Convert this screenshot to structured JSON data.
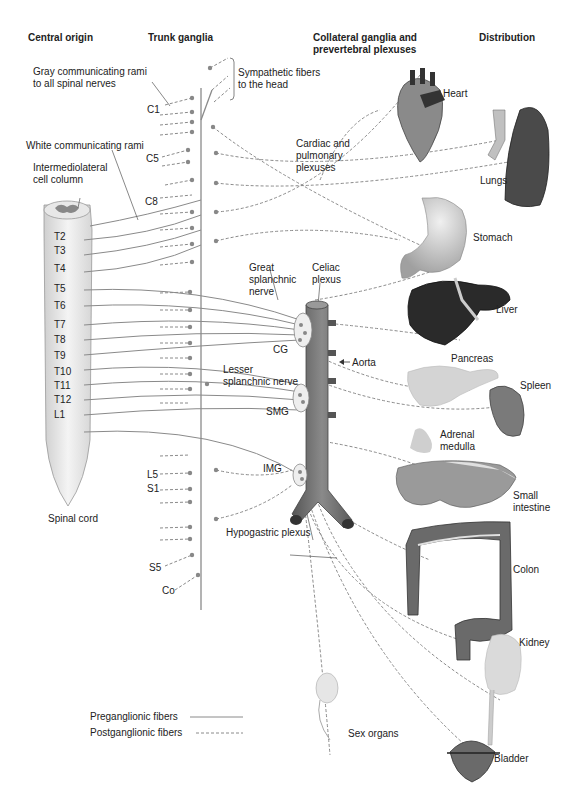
{
  "headers": {
    "central_origin": "Central origin",
    "trunk_ganglia": "Trunk ganglia",
    "collateral_line1": "Collateral ganglia and",
    "collateral_line2": "prevertebral plexuses",
    "distribution": "Distribution"
  },
  "annotations": {
    "gray_rami_1": "Gray communicating rami",
    "gray_rami_2": "to all spinal nerves",
    "symp_head_1": "Sympathetic fibers",
    "symp_head_2": "to the head",
    "white_rami": "White communicating rami",
    "iml_1": "Intermediolateral",
    "iml_2": "cell column",
    "cardiac_1": "Cardiac and",
    "cardiac_2": "pulmonary",
    "cardiac_3": "plexuses",
    "great_1": "Great",
    "great_2": "splanchnic",
    "great_3": "nerve",
    "celiac_1": "Celiac",
    "celiac_2": "plexus",
    "cg": "CG",
    "aorta": "Aorta",
    "lesser_1": "Lesser",
    "lesser_2": "splanchnic nerve",
    "smg": "SMG",
    "img": "IMG",
    "hypogastric": "Hypogastric plexus",
    "spinal_cord": "Spinal cord"
  },
  "segments": {
    "cervical": [
      "C1",
      "C5",
      "C8"
    ],
    "thoracic": [
      "T2",
      "T3",
      "T4",
      "T5",
      "T6",
      "T7",
      "T8",
      "T9",
      "T10",
      "T11",
      "T12",
      "L1"
    ],
    "lower": [
      "L5",
      "S1",
      "S5",
      "Co"
    ]
  },
  "organs": {
    "heart": "Heart",
    "lungs": "Lungs",
    "stomach": "Stomach",
    "liver": "Liver",
    "pancreas": "Pancreas",
    "spleen": "Spleen",
    "adrenal_1": "Adrenal",
    "adrenal_2": "medulla",
    "small_int_1": "Small",
    "small_int_2": "intestine",
    "colon": "Colon",
    "kidney": "Kidney",
    "sex_organs": "Sex organs",
    "bladder": "Bladder"
  },
  "legend": {
    "preganglionic": "Preganglionic fibers",
    "postganglionic": "Postganglionic fibers"
  },
  "colors": {
    "fiber": "#8a8a8a",
    "aorta": "#6e6e6e",
    "organ_dark": "#333333",
    "organ_mid": "#7a7a7a",
    "organ_light": "#cfcfcf"
  }
}
